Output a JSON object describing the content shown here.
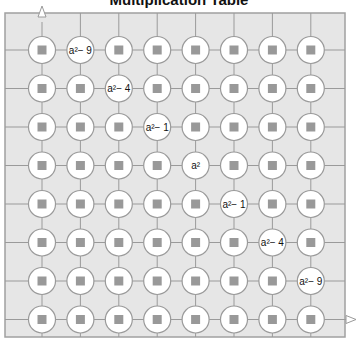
{
  "title": "Multiplication Table",
  "colors": {
    "background": "#e6e6e6",
    "line": "#9a9a9a",
    "circle": "#ffffff",
    "square": "#999999",
    "border": "#a0a0a0"
  },
  "grid": {
    "rows": 8,
    "cols": 8
  },
  "labels": [
    {
      "row": 0,
      "col": 1,
      "text": "a²− 9"
    },
    {
      "row": 1,
      "col": 2,
      "text": "a²− 4"
    },
    {
      "row": 2,
      "col": 3,
      "text": "a²− 1"
    },
    {
      "row": 3,
      "col": 4,
      "text": "a²"
    },
    {
      "row": 4,
      "col": 5,
      "text": "a²− 1"
    },
    {
      "row": 5,
      "col": 6,
      "text": "a²− 4"
    },
    {
      "row": 6,
      "col": 7,
      "text": "a²− 9"
    }
  ]
}
